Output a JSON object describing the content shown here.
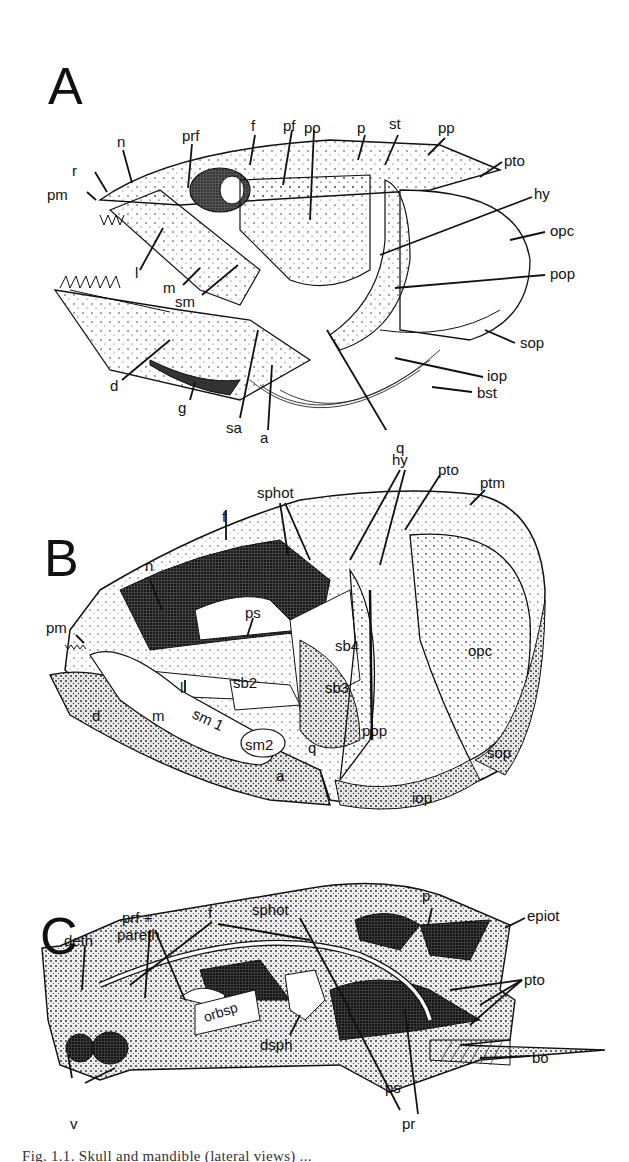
{
  "figure": {
    "panels": [
      {
        "letter": "A",
        "labels": {
          "pm": "pm",
          "r": "r",
          "n": "n",
          "prf": "prf",
          "f": "f",
          "pf": "pf",
          "po": "po",
          "p": "p",
          "st": "st",
          "pp": "pp",
          "pto": "pto",
          "hy": "hy",
          "opc": "opc",
          "l": "l",
          "m": "m",
          "sm": "sm",
          "pop": "pop",
          "sop": "sop",
          "iop": "iop",
          "bst": "bst",
          "d": "d",
          "g": "g",
          "sa": "sa",
          "a": "a",
          "q": "q"
        }
      },
      {
        "letter": "B",
        "labels": {
          "sphot": "sphot",
          "hy": "hy",
          "pto": "pto",
          "ptm": "ptm",
          "f": "f",
          "n": "n",
          "pm": "pm",
          "ps": "ps",
          "opc": "opc",
          "sb4": "sb4",
          "l": "l",
          "sb2": "sb2",
          "sb3": "sb3",
          "d": "d",
          "m": "m",
          "sm1": "sm 1",
          "sm2": "sm2",
          "q": "q",
          "pop": "pop",
          "a": "a",
          "sop": "sop",
          "iop": "iop"
        }
      },
      {
        "letter": "C",
        "labels": {
          "prf_pareth_1": "prf +",
          "prf_pareth_2": "pareth",
          "f": "f",
          "sphot": "sphot",
          "p": "p",
          "epiot": "epiot",
          "deth": "deth",
          "pto": "pto",
          "orbsp": "orbsp",
          "dsph": "dsph",
          "bo": "bo",
          "ps": "ps",
          "v": "v",
          "pr": "pr"
        }
      }
    ],
    "caption": "Fig. 1.1. Skull and mandible (lateral views) ..."
  }
}
